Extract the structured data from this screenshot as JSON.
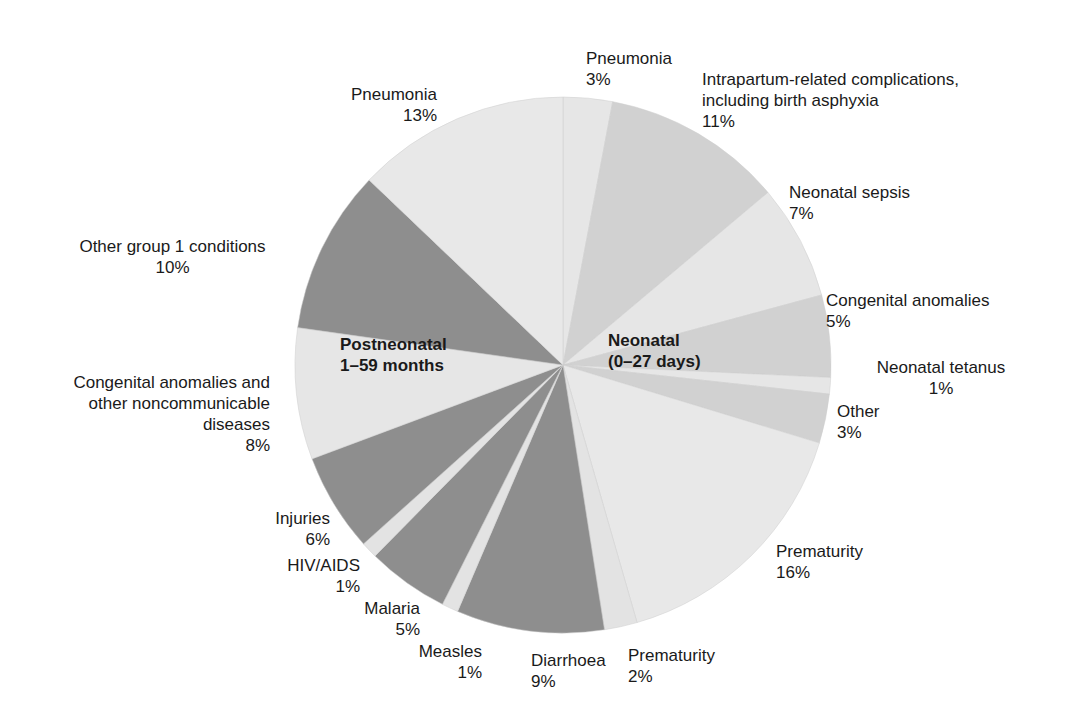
{
  "chart_data": {
    "type": "pie",
    "title": "",
    "start_angle_deg": 0,
    "direction": "clockwise",
    "groups": [
      {
        "name": "Neonatal (0–27 days)",
        "label_line1": "Neonatal",
        "label_line2": "(0–27 days)"
      },
      {
        "name": "Postneonatal 1–59 months",
        "label_line1": "Postneonatal",
        "label_line2": "1–59 months"
      }
    ],
    "slices": [
      {
        "label": "Pneumonia",
        "value": 3,
        "pct": "3%",
        "group": "Neonatal",
        "color": "#e6e6e6"
      },
      {
        "label": "Intrapartum-related complications, including birth asphyxia",
        "value": 11,
        "pct": "11%",
        "group": "Neonatal",
        "color": "#d1d1d1"
      },
      {
        "label": "Neonatal sepsis",
        "value": 7,
        "pct": "7%",
        "group": "Neonatal",
        "color": "#e6e6e6"
      },
      {
        "label": "Congenital anomalies",
        "value": 5,
        "pct": "5%",
        "group": "Neonatal",
        "color": "#d1d1d1"
      },
      {
        "label": "Neonatal tetanus",
        "value": 1,
        "pct": "1%",
        "group": "Neonatal",
        "color": "#e6e6e6"
      },
      {
        "label": "Other",
        "value": 3,
        "pct": "3%",
        "group": "Neonatal",
        "color": "#d1d1d1"
      },
      {
        "label": "Prematurity",
        "value": 16,
        "pct": "16%",
        "group": "Neonatal",
        "color": "#e8e8e8"
      },
      {
        "label": "Prematurity",
        "value": 2,
        "pct": "2%",
        "group": "Postneonatal",
        "color": "#e3e3e3"
      },
      {
        "label": "Diarrhoea",
        "value": 9,
        "pct": "9%",
        "group": "Postneonatal",
        "color": "#8e8e8e"
      },
      {
        "label": "Measles",
        "value": 1,
        "pct": "1%",
        "group": "Postneonatal",
        "color": "#e3e3e3"
      },
      {
        "label": "Malaria",
        "value": 5,
        "pct": "5%",
        "group": "Postneonatal",
        "color": "#8e8e8e"
      },
      {
        "label": "HIV/AIDS",
        "value": 1,
        "pct": "1%",
        "group": "Postneonatal",
        "color": "#e3e3e3"
      },
      {
        "label": "Injuries",
        "value": 6,
        "pct": "6%",
        "group": "Postneonatal",
        "color": "#8e8e8e"
      },
      {
        "label": "Congenital anomalies and other noncommunicable diseases",
        "value": 8,
        "pct": "8%",
        "group": "Postneonatal",
        "color": "#e6e6e6"
      },
      {
        "label": "Other group 1 conditions",
        "value": 10,
        "pct": "10%",
        "group": "Postneonatal",
        "color": "#8e8e8e"
      },
      {
        "label": "Pneumonia",
        "value": 13,
        "pct": "13%",
        "group": "Postneonatal",
        "color": "#e8e8e8"
      }
    ]
  },
  "labels": [
    {
      "lines": [
        "Pneumonia",
        "3%"
      ],
      "x": 586,
      "y": 48,
      "align": "l"
    },
    {
      "lines": [
        "Intrapartum-related complications,",
        "including birth asphyxia",
        "11%"
      ],
      "x": 702,
      "y": 69,
      "align": "l"
    },
    {
      "lines": [
        "Neonatal sepsis",
        "7%"
      ],
      "x": 789,
      "y": 182,
      "align": "l"
    },
    {
      "lines": [
        "Congenital anomalies",
        "5%"
      ],
      "x": 826,
      "y": 290,
      "align": "l"
    },
    {
      "lines": [
        "Neonatal tetanus",
        "1%"
      ],
      "x": 860,
      "y": 357,
      "align": "c",
      "w": 162
    },
    {
      "lines": [
        "Other",
        "3%"
      ],
      "x": 837,
      "y": 401,
      "align": "l"
    },
    {
      "lines": [
        "Prematurity",
        "16%"
      ],
      "x": 776,
      "y": 541,
      "align": "l"
    },
    {
      "lines": [
        "Prematurity",
        "2%"
      ],
      "x": 628,
      "y": 645,
      "align": "l"
    },
    {
      "lines": [
        "Diarrhoea",
        "9%"
      ],
      "x": 531,
      "y": 650,
      "align": "l"
    },
    {
      "lines": [
        "Measles",
        "1%"
      ],
      "x": 352,
      "y": 641,
      "align": "r",
      "w": 130
    },
    {
      "lines": [
        "Malaria",
        "5%"
      ],
      "x": 300,
      "y": 598,
      "align": "r",
      "w": 120
    },
    {
      "lines": [
        "HIV/AIDS",
        "1%"
      ],
      "x": 240,
      "y": 555,
      "align": "r",
      "w": 120
    },
    {
      "lines": [
        "Injuries",
        "6%"
      ],
      "x": 210,
      "y": 508,
      "align": "r",
      "w": 120
    },
    {
      "lines": [
        "Congenital anomalies and",
        "other noncommunicable",
        "diseases",
        "8%"
      ],
      "x": 20,
      "y": 372,
      "align": "r",
      "w": 250
    },
    {
      "lines": [
        "Other group 1 conditions",
        "10%"
      ],
      "x": 60,
      "y": 236,
      "align": "c",
      "w": 225
    },
    {
      "lines": [
        "Pneumonia",
        "13%"
      ],
      "x": 300,
      "y": 84,
      "align": "r",
      "w": 137
    }
  ]
}
